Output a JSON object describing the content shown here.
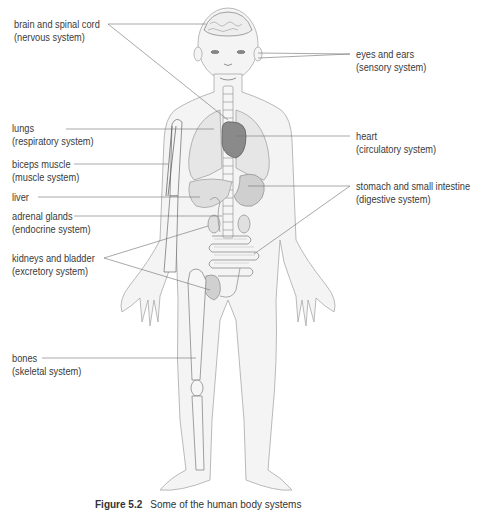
{
  "figure": {
    "caption_number": "Figure 5.2",
    "caption_text": "Some of the human body systems",
    "labels": [
      {
        "id": "brain",
        "line1": "brain and spinal cord",
        "line2": "(nervous system)"
      },
      {
        "id": "eyes",
        "line1": "eyes and ears",
        "line2": "(sensory system)"
      },
      {
        "id": "lungs",
        "line1": "lungs",
        "line2": "(respiratory system)"
      },
      {
        "id": "heart",
        "line1": "heart",
        "line2": "(circulatory system)"
      },
      {
        "id": "biceps",
        "line1": "biceps muscle",
        "line2": "(muscle system)"
      },
      {
        "id": "liver",
        "line1": "liver",
        "line2": ""
      },
      {
        "id": "stomach",
        "line1": "stomach and small intestine",
        "line2": "(digestive system)"
      },
      {
        "id": "adrenal",
        "line1": "adrenal glands",
        "line2": "(endocrine system)"
      },
      {
        "id": "kidneys",
        "line1": "kidneys and bladder",
        "line2": "(excretory system)"
      },
      {
        "id": "bones",
        "line1": "bones",
        "line2": "(skeletal system)"
      }
    ]
  },
  "colors": {
    "outline": "#9a9a9a",
    "body_fill": "#f3f3f3",
    "organ_fill": "#d9d9d9",
    "heart_fill": "#8c8c8c",
    "leader_line": "#707070",
    "text": "#3a3a3a"
  }
}
